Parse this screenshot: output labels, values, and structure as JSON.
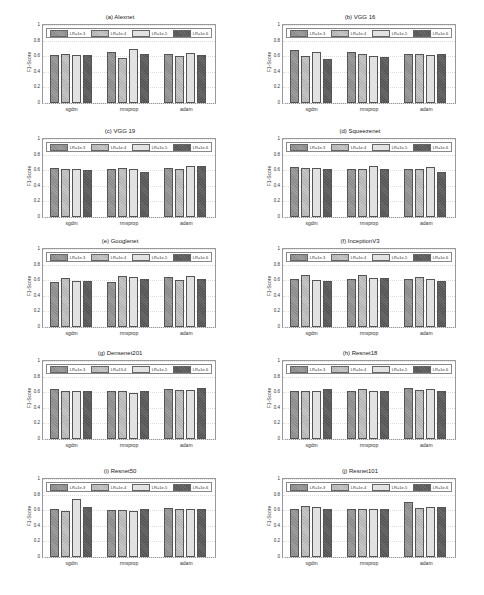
{
  "chart_data": [
    {
      "type": "bar",
      "title": "(a) Alexnet",
      "ylabel": "F1-Score",
      "ylim": [
        0,
        1
      ],
      "categories": [
        "sgdm",
        "rmsprop",
        "adam"
      ],
      "series": [
        {
          "name": "LR=1e-3",
          "values": [
            0.61,
            0.65,
            0.63
          ]
        },
        {
          "name": "LR=1e-4",
          "values": [
            0.63,
            0.58,
            0.6
          ]
        },
        {
          "name": "LR=1e-5",
          "values": [
            0.61,
            0.69,
            0.64
          ]
        },
        {
          "name": "LR=1e-6",
          "values": [
            0.61,
            0.63,
            0.62
          ]
        }
      ]
    },
    {
      "type": "bar",
      "title": "(b) VGG 16",
      "ylabel": "F1-Score",
      "ylim": [
        0,
        1
      ],
      "categories": [
        "sgdm",
        "rmsprop",
        "adam"
      ],
      "series": [
        {
          "name": "LR=1e-3",
          "values": [
            0.68,
            0.66,
            0.63
          ]
        },
        {
          "name": "LR=1e-4",
          "values": [
            0.6,
            0.63,
            0.63
          ]
        },
        {
          "name": "LR=1e-5",
          "values": [
            0.65,
            0.6,
            0.61
          ]
        },
        {
          "name": "LR=1e-6",
          "values": [
            0.57,
            0.59,
            0.63
          ]
        }
      ]
    },
    {
      "type": "bar",
      "title": "(c) VGG 19",
      "ylabel": "F1-Score",
      "ylim": [
        0,
        1
      ],
      "categories": [
        "sgdm",
        "rmsprop",
        "adam"
      ],
      "series": [
        {
          "name": "LR=1e-3",
          "values": [
            0.63,
            0.61,
            0.63
          ]
        },
        {
          "name": "LR=1e-4",
          "values": [
            0.62,
            0.63,
            0.61
          ]
        },
        {
          "name": "LR=1e-5",
          "values": [
            0.62,
            0.62,
            0.65
          ]
        },
        {
          "name": "LR=1e-6",
          "values": [
            0.6,
            0.58,
            0.66
          ]
        }
      ]
    },
    {
      "type": "bar",
      "title": "(d) Squeezenet",
      "ylabel": "F1-Score",
      "ylim": [
        0,
        1
      ],
      "categories": [
        "sgdm",
        "rmsprop",
        "adam"
      ],
      "series": [
        {
          "name": "LR=1e-3",
          "values": [
            0.64,
            0.61,
            0.61
          ]
        },
        {
          "name": "LR=1e-4",
          "values": [
            0.63,
            0.62,
            0.62
          ]
        },
        {
          "name": "LR=1e-5",
          "values": [
            0.63,
            0.65,
            0.64
          ]
        },
        {
          "name": "LR=1e-6",
          "values": [
            0.61,
            0.61,
            0.58
          ]
        }
      ]
    },
    {
      "type": "bar",
      "title": "(e) Googlenet",
      "ylabel": "F1-Score",
      "ylim": [
        0,
        1
      ],
      "categories": [
        "sgdm",
        "rmsprop",
        "adam"
      ],
      "series": [
        {
          "name": "LR=1e-3",
          "values": [
            0.58,
            0.58,
            0.64
          ]
        },
        {
          "name": "LR=1e-4",
          "values": [
            0.63,
            0.65,
            0.6
          ]
        },
        {
          "name": "LR=1e-5",
          "values": [
            0.59,
            0.64,
            0.65
          ]
        },
        {
          "name": "LR=1e-6",
          "values": [
            0.59,
            0.61,
            0.62
          ]
        }
      ]
    },
    {
      "type": "bar",
      "title": "(f) InceptionV3",
      "ylabel": "F1-Score",
      "ylim": [
        0,
        1
      ],
      "categories": [
        "sgdm",
        "rmsprop",
        "adam"
      ],
      "series": [
        {
          "name": "LR=1e-3",
          "values": [
            0.62,
            0.62,
            0.62
          ]
        },
        {
          "name": "LR=1e-4",
          "values": [
            0.67,
            0.67,
            0.64
          ]
        },
        {
          "name": "LR=1e-5",
          "values": [
            0.6,
            0.63,
            0.61
          ]
        },
        {
          "name": "LR=1e-6",
          "values": [
            0.59,
            0.63,
            0.59
          ]
        }
      ]
    },
    {
      "type": "bar",
      "title": "(g) Densenet201",
      "ylabel": "F1-Score",
      "ylim": [
        0,
        1
      ],
      "categories": [
        "sgdm",
        "rmsprop",
        "adam"
      ],
      "series": [
        {
          "name": "LR=1e-3",
          "values": [
            0.64,
            0.62,
            0.64
          ]
        },
        {
          "name": "LR=13-4",
          "values": [
            0.62,
            0.62,
            0.63
          ]
        },
        {
          "name": "LR=1e-5",
          "values": [
            0.62,
            0.59,
            0.63
          ]
        },
        {
          "name": "LR=1e-6",
          "values": [
            0.61,
            0.62,
            0.65
          ]
        }
      ]
    },
    {
      "type": "bar",
      "title": "(h) Resnet18",
      "ylabel": "F1-Score",
      "ylim": [
        0,
        1
      ],
      "categories": [
        "sgdm",
        "rmsprop",
        "adam"
      ],
      "series": [
        {
          "name": "LR=1e-3",
          "values": [
            0.62,
            0.62,
            0.66
          ]
        },
        {
          "name": "LR=1e-4",
          "values": [
            0.62,
            0.64,
            0.63
          ]
        },
        {
          "name": "LR=1e-5",
          "values": [
            0.62,
            0.61,
            0.64
          ]
        },
        {
          "name": "LR=1e-6",
          "values": [
            0.64,
            0.62,
            0.62
          ]
        }
      ]
    },
    {
      "type": "bar",
      "title": "(i) Resnet50",
      "ylabel": "F1-Score",
      "ylim": [
        0,
        1
      ],
      "categories": [
        "sgdm",
        "rmsprop",
        "adam"
      ],
      "series": [
        {
          "name": "LR=1e-3",
          "values": [
            0.61,
            0.6,
            0.63
          ]
        },
        {
          "name": "LR=1e-4",
          "values": [
            0.59,
            0.6,
            0.61
          ]
        },
        {
          "name": "LR=1e-5",
          "values": [
            0.74,
            0.59,
            0.61
          ]
        },
        {
          "name": "LR=1e-6",
          "values": [
            0.64,
            0.62,
            0.61
          ]
        }
      ]
    },
    {
      "type": "bar",
      "title": "(j) Resnet101",
      "ylabel": "F1-Score",
      "ylim": [
        0,
        1
      ],
      "categories": [
        "sgdm",
        "rmsprop",
        "adam"
      ],
      "series": [
        {
          "name": "LR=1e-3",
          "values": [
            0.62,
            0.61,
            0.7
          ]
        },
        {
          "name": "LR=1e-4",
          "values": [
            0.65,
            0.62,
            0.63
          ]
        },
        {
          "name": "LR=1e-5",
          "values": [
            0.64,
            0.62,
            0.64
          ]
        },
        {
          "name": "LR=1e-6",
          "values": [
            0.61,
            0.62,
            0.64
          ]
        }
      ]
    }
  ],
  "yticks": [
    "0",
    "0.2",
    "0.4",
    "0.6",
    "0.8",
    "1"
  ]
}
